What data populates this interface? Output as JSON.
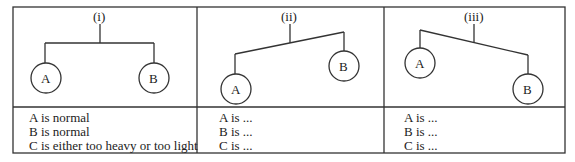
{
  "panels": [
    {
      "label": "(i)",
      "node_a": "A",
      "node_b": "B",
      "lines": [
        "A is normal",
        "B is normal",
        "C is either too heavy or too light"
      ]
    },
    {
      "label": "(ii)",
      "node_a": "A",
      "node_b": "B",
      "lines": [
        "A is ...",
        "B is ...",
        "C is ..."
      ]
    },
    {
      "label": "(iii)",
      "node_a": "A",
      "node_b": "B",
      "lines": [
        "A is ...",
        "B is ...",
        "C is ..."
      ]
    }
  ]
}
